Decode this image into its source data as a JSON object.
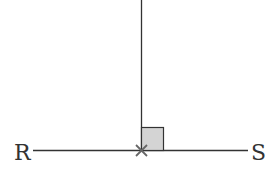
{
  "diagram": {
    "labels": {
      "left_point": "R",
      "right_point": "S"
    },
    "colors": {
      "line": "#333333",
      "right_angle_fill": "#d4d4d4",
      "cross_mark": "#666666"
    },
    "elements": [
      "segment RS (horizontal)",
      "perpendicular line (vertical) meeting RS",
      "right-angle marker",
      "cross mark at intersection point"
    ]
  }
}
